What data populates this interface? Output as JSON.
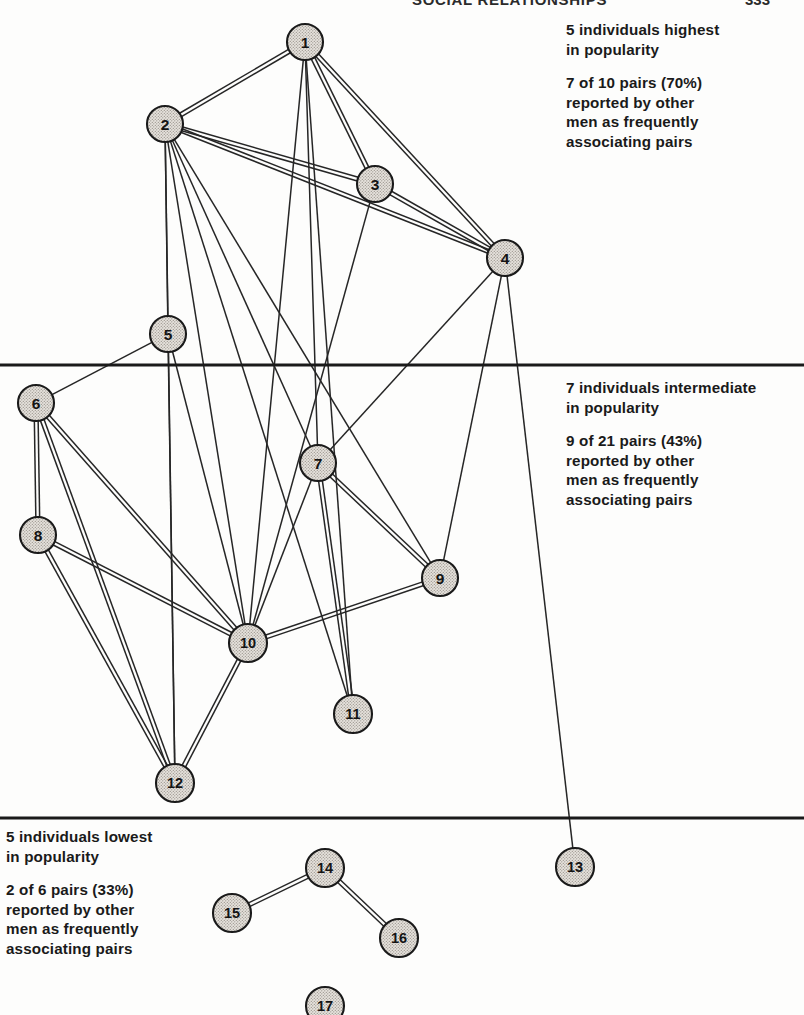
{
  "header": {
    "title": "SOCIAL RELATIONSHIPS",
    "page_number": "333"
  },
  "notes": {
    "high": {
      "line1": "5 individuals highest",
      "line2": "in popularity",
      "line3": "7 of 10 pairs (70%)",
      "line4": "reported by other",
      "line5": "men as frequently",
      "line6": "associating pairs"
    },
    "mid": {
      "line1": "7 individuals intermediate",
      "line2": "in popularity",
      "line3": "9 of 21 pairs (43%)",
      "line4": "reported by other",
      "line5": "men as frequently",
      "line6": "associating pairs"
    },
    "low": {
      "line1": "5 individuals lowest",
      "line2": "in popularity",
      "line3": "2 of 6 pairs (33%)",
      "line4": "reported by other",
      "line5": "men as frequently",
      "line6": "associating pairs"
    }
  },
  "colors": {
    "node_fill": "#dedad4",
    "node_stroke": "#1a1a1a",
    "edge": "#262626",
    "divider": "#1a1a1a",
    "text": "#1a1a1a",
    "background": "#fdfdfc"
  },
  "chart_data": {
    "type": "diagram",
    "diagram_kind": "sociogram",
    "node_radius": 19,
    "node_radius_small": 18,
    "bands": [
      {
        "id": "high",
        "label": "5 individuals highest in popularity",
        "members": [
          1,
          2,
          3,
          4,
          5
        ],
        "pairs_reported": 7,
        "pairs_possible": 10,
        "percent": 70
      },
      {
        "id": "intermediate",
        "label": "7 individuals intermediate in popularity",
        "members": [
          6,
          7,
          8,
          9,
          10,
          11,
          12
        ],
        "pairs_reported": 9,
        "pairs_possible": 21,
        "percent": 43
      },
      {
        "id": "low",
        "label": "5 individuals lowest in popularity",
        "members": [
          13,
          14,
          15,
          16,
          17
        ],
        "pairs_reported": 2,
        "pairs_possible": 6,
        "percent": 33
      }
    ],
    "dividers": [
      {
        "id": "divider-high-mid",
        "y": 365
      },
      {
        "id": "divider-mid-low",
        "y": 818
      }
    ],
    "nodes": [
      {
        "id": 1,
        "label": "1",
        "x": 305,
        "y": 42,
        "band": "high"
      },
      {
        "id": 2,
        "label": "2",
        "x": 165,
        "y": 124,
        "band": "high"
      },
      {
        "id": 3,
        "label": "3",
        "x": 375,
        "y": 184,
        "band": "high"
      },
      {
        "id": 4,
        "label": "4",
        "x": 505,
        "y": 258,
        "band": "high"
      },
      {
        "id": 5,
        "label": "5",
        "x": 168,
        "y": 334,
        "band": "high"
      },
      {
        "id": 6,
        "label": "6",
        "x": 36,
        "y": 403,
        "band": "intermediate"
      },
      {
        "id": 7,
        "label": "7",
        "x": 318,
        "y": 463,
        "band": "intermediate"
      },
      {
        "id": 8,
        "label": "8",
        "x": 38,
        "y": 535,
        "band": "intermediate"
      },
      {
        "id": 9,
        "label": "9",
        "x": 440,
        "y": 578,
        "band": "intermediate"
      },
      {
        "id": 10,
        "label": "10",
        "x": 248,
        "y": 643,
        "band": "intermediate"
      },
      {
        "id": 11,
        "label": "11",
        "x": 353,
        "y": 714,
        "band": "intermediate"
      },
      {
        "id": 12,
        "label": "12",
        "x": 175,
        "y": 783,
        "band": "intermediate"
      },
      {
        "id": 13,
        "label": "13",
        "x": 575,
        "y": 867,
        "band": "low"
      },
      {
        "id": 14,
        "label": "14",
        "x": 325,
        "y": 868,
        "band": "low"
      },
      {
        "id": 15,
        "label": "15",
        "x": 232,
        "y": 913,
        "band": "low"
      },
      {
        "id": 16,
        "label": "16",
        "x": 399,
        "y": 938,
        "band": "low"
      },
      {
        "id": 17,
        "label": "17",
        "x": 325,
        "y": 1006,
        "band": "low"
      }
    ],
    "edges": [
      {
        "source": 1,
        "target": 2,
        "style": "double"
      },
      {
        "source": 1,
        "target": 3,
        "style": "double"
      },
      {
        "source": 1,
        "target": 4,
        "style": "double"
      },
      {
        "source": 1,
        "target": 7,
        "style": "single"
      },
      {
        "source": 1,
        "target": 10,
        "style": "single"
      },
      {
        "source": 1,
        "target": 11,
        "style": "single"
      },
      {
        "source": 2,
        "target": 3,
        "style": "double"
      },
      {
        "source": 2,
        "target": 4,
        "style": "double"
      },
      {
        "source": 2,
        "target": 5,
        "style": "single"
      },
      {
        "source": 2,
        "target": 7,
        "style": "single"
      },
      {
        "source": 2,
        "target": 9,
        "style": "single"
      },
      {
        "source": 2,
        "target": 10,
        "style": "single"
      },
      {
        "source": 2,
        "target": 11,
        "style": "single"
      },
      {
        "source": 2,
        "target": 12,
        "style": "single"
      },
      {
        "source": 3,
        "target": 4,
        "style": "double"
      },
      {
        "source": 3,
        "target": 10,
        "style": "single"
      },
      {
        "source": 4,
        "target": 7,
        "style": "single"
      },
      {
        "source": 4,
        "target": 9,
        "style": "single"
      },
      {
        "source": 4,
        "target": 13,
        "style": "single"
      },
      {
        "source": 5,
        "target": 6,
        "style": "single"
      },
      {
        "source": 5,
        "target": 10,
        "style": "single"
      },
      {
        "source": 5,
        "target": 12,
        "style": "single"
      },
      {
        "source": 6,
        "target": 8,
        "style": "double"
      },
      {
        "source": 6,
        "target": 10,
        "style": "double"
      },
      {
        "source": 6,
        "target": 12,
        "style": "double"
      },
      {
        "source": 7,
        "target": 9,
        "style": "double"
      },
      {
        "source": 7,
        "target": 11,
        "style": "double"
      },
      {
        "source": 7,
        "target": 10,
        "style": "single"
      },
      {
        "source": 8,
        "target": 10,
        "style": "double"
      },
      {
        "source": 8,
        "target": 12,
        "style": "double"
      },
      {
        "source": 9,
        "target": 10,
        "style": "double"
      },
      {
        "source": 10,
        "target": 12,
        "style": "double"
      },
      {
        "source": 14,
        "target": 15,
        "style": "double"
      },
      {
        "source": 14,
        "target": 16,
        "style": "double"
      }
    ]
  }
}
